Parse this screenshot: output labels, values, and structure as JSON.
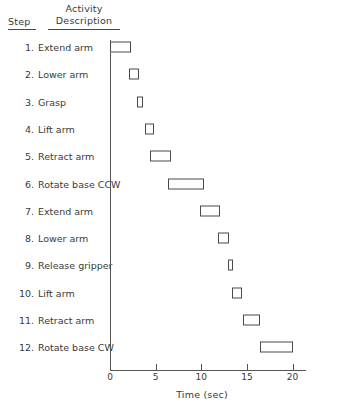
{
  "header": {
    "step_label": "Step",
    "activity_line1": "Activity",
    "activity_line2": "Description"
  },
  "axis": {
    "x_title": "Time (sec)",
    "tick_labels": [
      "0",
      "5",
      "10",
      "15",
      "20"
    ],
    "tick_values": [
      0,
      5,
      10,
      15,
      20
    ],
    "xlim": [
      0,
      21.5
    ]
  },
  "colors": {
    "line": "#4a4a4a",
    "text": "#3a3a3a",
    "bar_fill": "#ffffff"
  },
  "rows": [
    {
      "step": "1.",
      "description": "Extend arm"
    },
    {
      "step": "2.",
      "description": "Lower arm"
    },
    {
      "step": "3.",
      "description": "Grasp"
    },
    {
      "step": "4.",
      "description": "Lift arm"
    },
    {
      "step": "5.",
      "description": "Retract arm"
    },
    {
      "step": "6.",
      "description": "Rotate base CCW"
    },
    {
      "step": "7.",
      "description": "Extend arm"
    },
    {
      "step": "8.",
      "description": "Lower arm"
    },
    {
      "step": "9.",
      "description": "Release gripper"
    },
    {
      "step": "10.",
      "description": "Lift arm"
    },
    {
      "step": "11.",
      "description": "Retract arm"
    },
    {
      "step": "12.",
      "description": "Rotate base CW"
    }
  ],
  "chart_data": {
    "type": "bar",
    "title": "",
    "xlabel": "Time (sec)",
    "ylabel": "",
    "orientation": "horizontal",
    "subtype": "gantt",
    "grid": false,
    "legend": false,
    "xlim": [
      0,
      21.5
    ],
    "xticks": [
      0,
      5,
      10,
      15,
      20
    ],
    "categories": [
      "1. Extend arm",
      "2. Lower arm",
      "3. Grasp",
      "4. Lift arm",
      "5. Retract arm",
      "6. Rotate base CCW",
      "7. Extend arm",
      "8. Lower arm",
      "9. Release gripper",
      "10. Lift arm",
      "11. Retract arm",
      "12. Rotate base CW"
    ],
    "tasks": [
      {
        "step": 1,
        "label": "Extend arm",
        "start": 0.0,
        "end": 2.3,
        "duration": 2.3
      },
      {
        "step": 2,
        "label": "Lower arm",
        "start": 2.1,
        "end": 3.2,
        "duration": 1.1
      },
      {
        "step": 3,
        "label": "Grasp",
        "start": 3.0,
        "end": 3.6,
        "duration": 0.6
      },
      {
        "step": 4,
        "label": "Lift arm",
        "start": 3.8,
        "end": 4.8,
        "duration": 1.0
      },
      {
        "step": 5,
        "label": "Retract arm",
        "start": 4.4,
        "end": 6.7,
        "duration": 2.3
      },
      {
        "step": 6,
        "label": "Rotate base CCW",
        "start": 6.4,
        "end": 10.3,
        "duration": 3.9
      },
      {
        "step": 7,
        "label": "Extend arm",
        "start": 9.9,
        "end": 12.0,
        "duration": 2.1
      },
      {
        "step": 8,
        "label": "Lower arm",
        "start": 11.8,
        "end": 13.0,
        "duration": 1.2
      },
      {
        "step": 9,
        "label": "Release gripper",
        "start": 12.9,
        "end": 13.5,
        "duration": 0.6
      },
      {
        "step": 10,
        "label": "Lift arm",
        "start": 13.4,
        "end": 14.5,
        "duration": 1.1
      },
      {
        "step": 11,
        "label": "Retract arm",
        "start": 14.6,
        "end": 16.4,
        "duration": 1.8
      },
      {
        "step": 12,
        "label": "Rotate base CW",
        "start": 16.4,
        "end": 20.0,
        "duration": 3.6
      }
    ]
  }
}
